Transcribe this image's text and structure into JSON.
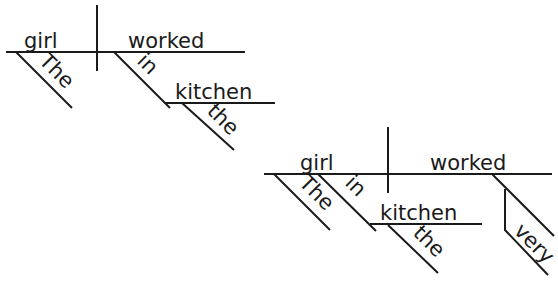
{
  "diagrams": [
    {
      "id": "diagram-1",
      "sentence": "The girl worked in the kitchen",
      "words": {
        "subject": "girl",
        "subject_modifier": "The",
        "verb": "worked",
        "preposition": "in",
        "object_of_preposition": "kitchen",
        "object_modifier": "the"
      }
    },
    {
      "id": "diagram-2",
      "sentence": "The girl in the kitchen worked very",
      "words": {
        "subject": "girl",
        "subject_modifier": "The",
        "preposition": "in",
        "object_of_preposition": "kitchen",
        "object_modifier": "the",
        "verb": "worked",
        "verb_modifier": "very"
      }
    }
  ],
  "colors": {
    "ink": "#1a1a1a",
    "background": "#ffffff"
  }
}
